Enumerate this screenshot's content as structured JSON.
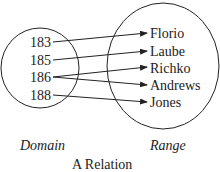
{
  "diagram": {
    "caption": "A Relation",
    "domain_label": "Domain",
    "range_label": "Range",
    "domain": [
      "183",
      "185",
      "186",
      "188"
    ],
    "range": [
      "Florio",
      "Laube",
      "Richko",
      "Andrews",
      "Jones"
    ],
    "mappings": [
      {
        "from": "183",
        "to": "Florio"
      },
      {
        "from": "185",
        "to": "Laube"
      },
      {
        "from": "186",
        "to": "Richko"
      },
      {
        "from": "186",
        "to": "Andrews"
      },
      {
        "from": "188",
        "to": "Jones"
      }
    ],
    "colors": {
      "stroke": "#222222",
      "background": "#ffffff"
    }
  }
}
